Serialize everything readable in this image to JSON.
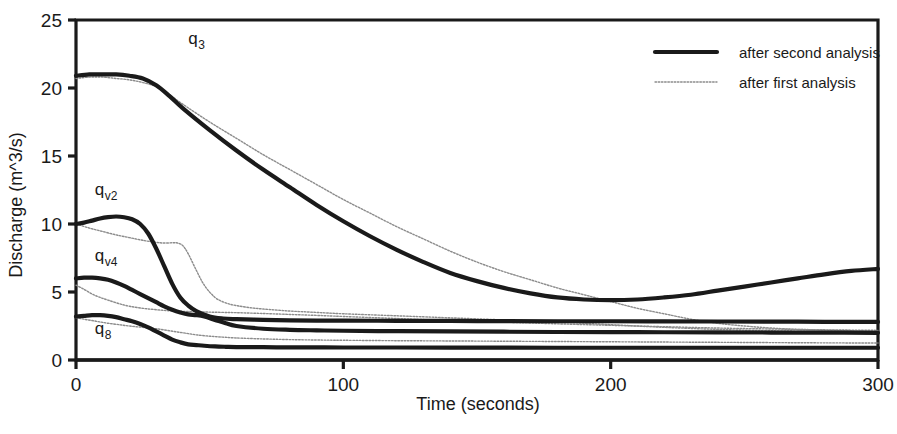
{
  "chart_data": {
    "type": "line",
    "title": "",
    "xlabel": "Time (seconds)",
    "ylabel": "Discharge (m^3/s)",
    "xlim": [
      0,
      300
    ],
    "ylim": [
      0,
      25
    ],
    "xticks": [
      0,
      100,
      200,
      300
    ],
    "yticks": [
      0,
      5,
      10,
      15,
      20,
      25
    ],
    "xtick_labels": [
      "0",
      "100",
      "200",
      "300"
    ],
    "ytick_labels": [
      "0",
      "5",
      "10",
      "15",
      "20",
      "25"
    ],
    "grid": false,
    "frame": "box",
    "legend": {
      "position": "top-right",
      "entries": [
        {
          "label": "after second analysis",
          "style": "thick-solid",
          "color": "#1a1a1a",
          "width": 4.2
        },
        {
          "label": "after first analysis",
          "style": "thin-dotted",
          "color": "#8c8c8c",
          "width": 1.3
        }
      ]
    },
    "curve_labels": [
      {
        "text": "q",
        "sub": "3",
        "x": 42,
        "y": 23.2
      },
      {
        "text": "q",
        "sub": "v2",
        "x": 7,
        "y": 12.1
      },
      {
        "text": "q",
        "sub": "v4",
        "x": 7,
        "y": 7.3
      },
      {
        "text": "q",
        "sub": "8",
        "x": 7,
        "y": 1.9
      }
    ],
    "series": [
      {
        "name": "q3 after second analysis",
        "analysis": "second",
        "style": "thick-solid",
        "x": [
          0,
          5,
          10,
          15,
          20,
          25,
          30,
          35,
          40,
          50,
          60,
          70,
          80,
          90,
          100,
          110,
          120,
          130,
          140,
          150,
          160,
          170,
          180,
          190,
          200,
          210,
          220,
          230,
          240,
          250,
          260,
          270,
          280,
          290,
          300
        ],
        "values": [
          20.9,
          21.0,
          21.0,
          21.0,
          20.9,
          20.7,
          20.2,
          19.4,
          18.5,
          16.9,
          15.4,
          14.0,
          12.7,
          11.4,
          10.2,
          9.1,
          8.1,
          7.2,
          6.4,
          5.8,
          5.3,
          4.9,
          4.6,
          4.45,
          4.4,
          4.45,
          4.6,
          4.8,
          5.1,
          5.4,
          5.7,
          6.0,
          6.3,
          6.55,
          6.7
        ]
      },
      {
        "name": "q3 after first analysis",
        "analysis": "first",
        "style": "thin-dotted",
        "x": [
          0,
          5,
          10,
          15,
          20,
          25,
          30,
          35,
          40,
          50,
          60,
          70,
          80,
          90,
          100,
          110,
          120,
          130,
          140,
          150,
          160,
          170,
          180,
          190,
          200,
          210,
          220,
          230,
          240,
          250,
          260,
          270,
          280,
          290,
          300
        ],
        "values": [
          20.7,
          20.8,
          20.8,
          20.7,
          20.6,
          20.4,
          20.1,
          19.5,
          18.8,
          17.5,
          16.3,
          15.1,
          14.0,
          12.9,
          11.8,
          10.8,
          9.8,
          8.9,
          8.0,
          7.2,
          6.5,
          5.9,
          5.3,
          4.8,
          4.3,
          3.8,
          3.4,
          3.0,
          2.7,
          2.5,
          2.35,
          2.25,
          2.2,
          2.15,
          2.1
        ]
      },
      {
        "name": "qv2 after second analysis",
        "analysis": "second",
        "style": "thick-solid",
        "x": [
          0,
          3,
          6,
          9,
          12,
          15,
          18,
          21,
          24,
          27,
          30,
          33,
          36,
          39,
          42,
          45,
          50,
          55,
          60,
          70,
          80,
          90,
          100,
          120,
          140,
          160,
          180,
          200,
          220,
          240,
          260,
          280,
          300
        ],
        "values": [
          10.0,
          10.1,
          10.25,
          10.4,
          10.5,
          10.55,
          10.5,
          10.35,
          10.0,
          9.3,
          8.2,
          6.9,
          5.6,
          4.6,
          4.0,
          3.6,
          3.2,
          3.05,
          3.0,
          2.95,
          2.92,
          2.9,
          2.9,
          2.88,
          2.87,
          2.86,
          2.85,
          2.85,
          2.84,
          2.83,
          2.82,
          2.81,
          2.8
        ]
      },
      {
        "name": "qv2 after first analysis",
        "analysis": "first",
        "style": "thin-dotted",
        "x": [
          0,
          5,
          10,
          15,
          20,
          25,
          30,
          33,
          36,
          38,
          40,
          42,
          45,
          48,
          52,
          56,
          60,
          65,
          70,
          80,
          90,
          100,
          120,
          140,
          160,
          180,
          200,
          220,
          240,
          260,
          280,
          300
        ],
        "values": [
          10.0,
          9.7,
          9.45,
          9.2,
          9.0,
          8.8,
          8.65,
          8.6,
          8.62,
          8.6,
          8.4,
          7.8,
          6.6,
          5.5,
          4.6,
          4.2,
          4.0,
          3.85,
          3.75,
          3.6,
          3.5,
          3.4,
          3.25,
          3.1,
          2.95,
          2.8,
          2.6,
          2.4,
          2.25,
          2.15,
          2.1,
          2.05
        ]
      },
      {
        "name": "qv4 after second analysis",
        "analysis": "second",
        "style": "thick-solid",
        "x": [
          0,
          3,
          6,
          9,
          12,
          15,
          18,
          21,
          24,
          27,
          30,
          33,
          36,
          39,
          42,
          45,
          48,
          52,
          56,
          60,
          70,
          80,
          90,
          100,
          120,
          140,
          160,
          180,
          200,
          220,
          240,
          260,
          280,
          300
        ],
        "values": [
          6.0,
          6.05,
          6.05,
          6.0,
          5.9,
          5.7,
          5.45,
          5.15,
          4.85,
          4.55,
          4.25,
          3.95,
          3.7,
          3.5,
          3.35,
          3.3,
          3.2,
          2.95,
          2.7,
          2.5,
          2.3,
          2.22,
          2.18,
          2.15,
          2.12,
          2.1,
          2.08,
          2.06,
          2.05,
          2.04,
          2.03,
          2.02,
          2.01,
          2.0
        ]
      },
      {
        "name": "qv4 after first analysis",
        "analysis": "first",
        "style": "thin-dotted",
        "x": [
          0,
          3,
          6,
          9,
          12,
          16,
          20,
          25,
          30,
          35,
          40,
          45,
          50,
          55,
          60,
          70,
          80,
          90,
          100,
          120,
          140,
          160,
          180,
          200,
          220,
          240,
          260,
          280,
          300
        ],
        "values": [
          5.5,
          5.2,
          4.85,
          4.6,
          4.4,
          4.15,
          3.95,
          3.8,
          3.7,
          3.62,
          3.58,
          3.55,
          3.52,
          3.5,
          3.48,
          3.42,
          3.35,
          3.28,
          3.2,
          3.05,
          2.9,
          2.78,
          2.66,
          2.55,
          2.45,
          2.35,
          2.28,
          2.22,
          2.18
        ]
      },
      {
        "name": "q8 after second analysis",
        "analysis": "second",
        "style": "thick-solid",
        "x": [
          0,
          3,
          6,
          9,
          12,
          15,
          18,
          21,
          24,
          27,
          30,
          33,
          36,
          39,
          42,
          45,
          48,
          52,
          56,
          60,
          70,
          80,
          90,
          100,
          120,
          140,
          160,
          180,
          200,
          220,
          240,
          260,
          280,
          300
        ],
        "values": [
          3.2,
          3.25,
          3.3,
          3.3,
          3.25,
          3.15,
          3.0,
          2.85,
          2.65,
          2.4,
          2.1,
          1.8,
          1.5,
          1.3,
          1.15,
          1.1,
          1.05,
          1.0,
          0.97,
          0.95,
          0.94,
          0.93,
          0.93,
          0.92,
          0.92,
          0.91,
          0.91,
          0.9,
          0.9,
          0.9,
          0.9,
          0.9,
          0.9,
          0.9
        ]
      },
      {
        "name": "q8 after first analysis",
        "analysis": "first",
        "style": "thin-dotted",
        "x": [
          0,
          3,
          6,
          9,
          12,
          16,
          20,
          25,
          30,
          35,
          40,
          45,
          50,
          55,
          60,
          70,
          80,
          90,
          100,
          120,
          140,
          160,
          180,
          200,
          220,
          240,
          260,
          280,
          300
        ],
        "values": [
          3.1,
          3.0,
          2.9,
          2.8,
          2.7,
          2.6,
          2.5,
          2.4,
          2.3,
          2.15,
          2.0,
          1.85,
          1.75,
          1.68,
          1.62,
          1.55,
          1.5,
          1.47,
          1.45,
          1.42,
          1.4,
          1.38,
          1.36,
          1.34,
          1.32,
          1.3,
          1.28,
          1.26,
          1.25
        ]
      }
    ]
  },
  "colors": {
    "axis": "#1a1a1a",
    "second_analysis": "#1a1a1a",
    "first_analysis": "#8c8c8c",
    "background": "#ffffff"
  }
}
